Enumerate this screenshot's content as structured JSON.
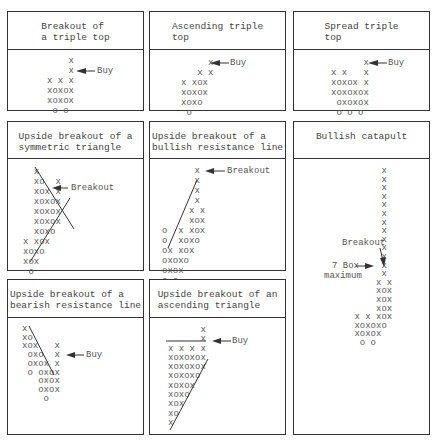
{
  "panels": [
    {
      "id": "breakout-triple-top",
      "title": "Breakout of\na triple top",
      "grid": "    x\n    x\nx x x\nxoxox\nxoxox\n o o",
      "annotation": "Buy"
    },
    {
      "id": "ascending-triple-top",
      "title": "Ascending triple\ntop",
      "grid": "     x\n   x x\nx xox\nxoxox\nxoxo\n o",
      "annotation": "Buy"
    },
    {
      "id": "spread-triple-top",
      "title": "Spread triple\ntop",
      "grid": "      x\nx x   x\nxoxox x\nxoxoxox\n oxoxox\n o o o",
      "annotation": "Buy"
    },
    {
      "id": "upside-breakout-symmetric-triangle",
      "title": "Upside breakout of a\nsymmetric triangle",
      "grid": "  x\n  xo  x\n  xox x\n  xoxox\n  xoxox\n  xoxox\n  xoxo\nx xox\nxoxo\nxox\n o",
      "annotation": "Breakout"
    },
    {
      "id": "upside-breakout-bullish-resistance-line",
      "title": "Upside breakout of a\nbullish resistance line",
      "grid": "      x\n      x\n      x\n      x\n     x x\n     xox\no  x xox\no  xoxo\nox xox\noxoxo\noxox\no o",
      "annotation": "Breakout"
    },
    {
      "id": "bullish-catapult",
      "title": "Bullish catapult",
      "grid": "      x\n      x\n      x\n      x\n      x\n      x\n      x\n      x\n      x\n      x\n      x\n      x\n      x\n     x x\n     xox\n     xox\n     xox\n x x xox\n xoxoxo\n xoxox\n  o o",
      "annotation_breakout": "Breakout",
      "annotation_box_line1": "7 Box",
      "annotation_box_line2": "maximum"
    },
    {
      "id": "upside-breakout-bearish-resistance-line",
      "title": "Upside breakout of a\nbearish resistance line",
      "grid": "x\nxo\nxox   x\n oxo  x\n oxox x\n o oxox\n   oxox\n   oxox\n    o",
      "annotation": "Buy"
    },
    {
      "id": "upside-breakout-ascending-triangle",
      "title": "Upside breakout of an\nascending triangle",
      "grid": "      x\n      x\nx x x x\nxoxoxox\nxoxoxox\nxoxoxo\nxoxox\nxoxo\nxox\nxo\nx",
      "annotation": "Buy"
    }
  ],
  "colors": {
    "border": "#333333",
    "text": "#555555",
    "line": "#333333"
  }
}
